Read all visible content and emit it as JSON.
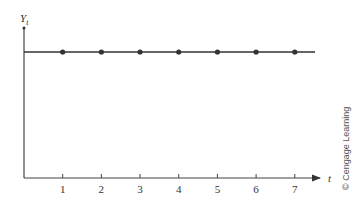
{
  "chart_data": {
    "type": "line",
    "title": "",
    "xlabel": "t",
    "ylabel": "Y",
    "ylabel_subscript": "t",
    "x": [
      1,
      2,
      3,
      4,
      5,
      6,
      7
    ],
    "series": [
      {
        "name": "Y_t",
        "values": [
          1,
          1,
          1,
          1,
          1,
          1,
          1
        ],
        "color": "#333333",
        "markers": true
      }
    ],
    "x_tick_labels": [
      "1",
      "2",
      "3",
      "4",
      "5",
      "6",
      "7"
    ],
    "xlim": [
      0,
      7.6
    ],
    "ylim": [
      0,
      1.27
    ],
    "line_extends_full_width": true,
    "grid": false,
    "legend": "none"
  },
  "copyright": "© Cengage Learning"
}
